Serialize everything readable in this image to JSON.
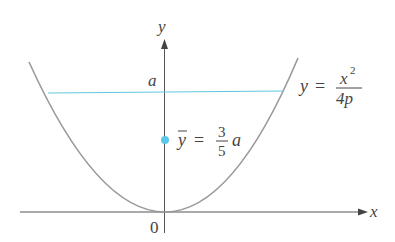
{
  "figure": {
    "axes": {
      "x_label": "x",
      "y_label": "y",
      "origin_label": "0"
    },
    "level_label": "a",
    "curve_label": {
      "lhs": "y",
      "eq": "=",
      "numerator": "x",
      "exponent": "2",
      "denominator": "4p"
    },
    "centroid_label": {
      "lhs": "y",
      "eq": "=",
      "numerator": "3",
      "denominator": "5",
      "suffix": "a"
    },
    "colors": {
      "curve": "#9a9a9a",
      "axis": "#555555",
      "level_line": "#5fc8e0",
      "centroid_dot": "#5bc8ea"
    }
  }
}
